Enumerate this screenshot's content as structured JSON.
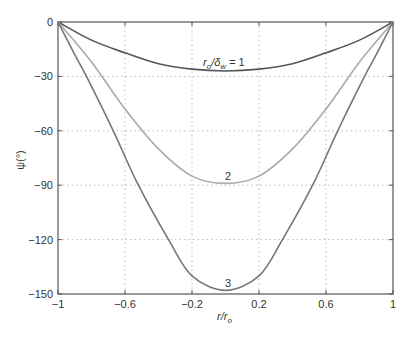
{
  "chart_data": {
    "type": "line",
    "title": "",
    "xlabel": "r/r_o",
    "ylabel": "ψ(°)",
    "xlim": [
      -1,
      1
    ],
    "ylim": [
      -150,
      0
    ],
    "grid": true,
    "x_ticks": [
      -1,
      -0.6,
      -0.2,
      0.2,
      0.6,
      1
    ],
    "x_tick_labels": [
      "−1",
      "−0.6",
      "−0.2",
      "0.2",
      "0.6",
      "1"
    ],
    "y_ticks": [
      0,
      -30,
      -60,
      -90,
      -120,
      -150
    ],
    "y_tick_labels": [
      "0",
      "−30",
      "−60",
      "−90",
      "−120",
      "−150"
    ],
    "series": [
      {
        "name": "r_o/δ_w = 1",
        "color": "#555555",
        "x": [
          -1,
          -0.8,
          -0.6,
          -0.4,
          -0.2,
          0,
          0.2,
          0.4,
          0.6,
          0.8,
          1
        ],
        "values": [
          0,
          -10,
          -17,
          -23,
          -26,
          -27,
          -26,
          -23,
          -17,
          -10,
          0
        ]
      },
      {
        "name": "2",
        "color": "#aaaaaa",
        "x": [
          -1,
          -0.8,
          -0.6,
          -0.4,
          -0.2,
          0,
          0.2,
          0.4,
          0.6,
          0.8,
          1
        ],
        "values": [
          0,
          -22,
          -48,
          -70,
          -85,
          -89,
          -85,
          -70,
          -48,
          -22,
          0
        ]
      },
      {
        "name": "3",
        "color": "#777777",
        "x": [
          -1,
          -0.9,
          -0.83,
          -0.67,
          -0.52,
          -0.34,
          -0.2,
          0,
          0.2,
          0.34,
          0.52,
          0.67,
          0.83,
          0.9,
          1
        ],
        "values": [
          0,
          -18,
          -30,
          -60,
          -90,
          -120,
          -140,
          -148,
          -140,
          -120,
          -90,
          -60,
          -30,
          -18,
          0
        ]
      }
    ],
    "annotations": [
      {
        "text": "r_o/δ_w = 1",
        "x": 0.05,
        "y": -20
      },
      {
        "text": "2",
        "x": 0.02,
        "y": -82
      },
      {
        "text": "3",
        "x": 0.02,
        "y": -140
      }
    ]
  },
  "labels": {
    "xlabel_main": "r/r",
    "xlabel_sub": "o",
    "ylabel": "ψ(°)",
    "ann1_main": "r",
    "ann1_sub1": "o",
    "ann1_mid": "/δ",
    "ann1_sub2": "w",
    "ann1_tail": " = 1",
    "ann2": "2",
    "ann3": "3"
  }
}
